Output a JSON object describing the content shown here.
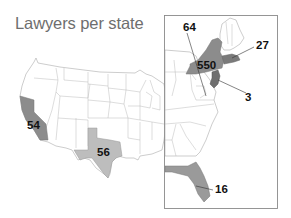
{
  "title": "Lawyers per state",
  "colors": {
    "background": "#ffffff",
    "state_fill": "#ffffff",
    "state_border": "#9a9a9a",
    "shade_dark": "#8c8c8c",
    "shade_medium": "#a3a3a3",
    "shade_light": "#bdbdbd",
    "inset_border": "#8a8a8a",
    "label": "#111111",
    "title": "#6e6e6e"
  },
  "map": {
    "region": "United States (contiguous)",
    "inset": "East Coast",
    "labels": [
      {
        "state": "California",
        "value": "54"
      },
      {
        "state": "Texas",
        "value": "56"
      },
      {
        "state": "New York",
        "value": "550"
      },
      {
        "state": "District of Columbia",
        "value": "64"
      },
      {
        "state": "Massachusetts",
        "value": "27"
      },
      {
        "state": "New Jersey",
        "value": "3"
      },
      {
        "state": "Florida",
        "value": "16"
      }
    ]
  }
}
